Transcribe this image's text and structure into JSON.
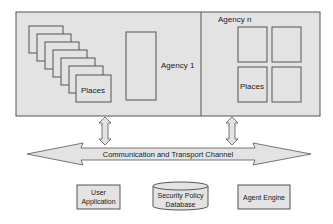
{
  "diagram": {
    "colors": {
      "fill": "#e3e3e3",
      "stroke": "#555555",
      "background": "#ffffff",
      "text": "#1a1a1a"
    },
    "agency1": {
      "label": "Agency 1",
      "places_label": "Places",
      "stacked_places_count": 7
    },
    "agencyN": {
      "label": "Agency n",
      "places_label": "Places",
      "place_grid": "2x2"
    },
    "channel": {
      "label": "Communication and Transport Channel"
    },
    "bottom": {
      "user_application": {
        "line1": "User",
        "line2": "Application"
      },
      "security_db": {
        "line1": "Security Policy",
        "line2": "Database"
      },
      "agent_engine": {
        "label": "Agent Engine"
      }
    }
  }
}
